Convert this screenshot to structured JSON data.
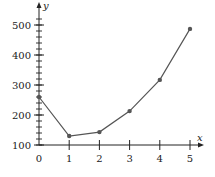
{
  "chart_data": {
    "type": "line",
    "title": "",
    "xlabel": "x",
    "ylabel": "y",
    "x": [
      0,
      1,
      2,
      3,
      4,
      5
    ],
    "series": [
      {
        "name": "y",
        "values": [
          260,
          130,
          143,
          213,
          317,
          487
        ]
      }
    ],
    "x_ticks": [
      "0",
      "1",
      "2",
      "3",
      "4",
      "5"
    ],
    "y_ticks": [
      "100",
      "200",
      "300",
      "400",
      "500"
    ],
    "xlim": [
      0,
      5.4
    ],
    "ylim": [
      100,
      540
    ],
    "y_minor_tick_step": 20,
    "grid": false,
    "legend": "none",
    "colors": {
      "line": "#555555",
      "marker": "#555555",
      "axis": "#222222"
    }
  }
}
